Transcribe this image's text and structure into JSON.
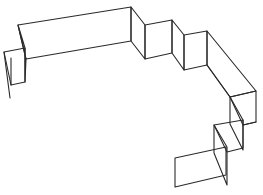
{
  "figure": {
    "colors": {
      "background": "#ffffff",
      "stroke": "#2a2a2a",
      "face": "#ffffff"
    },
    "panels": [
      {
        "name": "left-end-panel",
        "points": "4,52 25,48 25,82 11,85"
      },
      {
        "name": "left-fold",
        "points": "18,25 25,48 25,82 26,59"
      },
      {
        "name": "long-front-panel",
        "points": "18,25 131,7 131,41 26,59"
      },
      {
        "name": "fold-1",
        "points": "131,7 145,25 145,59 131,41"
      },
      {
        "name": "panel-2",
        "points": "145,25 172,20 172,53 145,59"
      },
      {
        "name": "fold-2",
        "points": "172,20 184,35 184,70 172,53"
      },
      {
        "name": "panel-3",
        "points": "184,35 207,31 207,65 184,70"
      },
      {
        "name": "long-diagonal-top",
        "points": "207,31 256,91 230,97 207,65"
      },
      {
        "name": "end-face-upper",
        "points": "230,97 256,91 256,122 243,125"
      },
      {
        "name": "step-fold-upper",
        "points": "230,97 243,120 243,150 230,124"
      },
      {
        "name": "step-panel-middle",
        "points": "214,125 243,120 243,148 227,152"
      },
      {
        "name": "step-fold-lower",
        "points": "214,125 227,147 227,185 214,153"
      },
      {
        "name": "bottom-panel",
        "points": "175,158 226,147 226,175 175,187"
      }
    ],
    "extra_lines": [
      {
        "name": "left-vertical-back",
        "d": "M4,52 L10,98"
      },
      {
        "name": "left-inner-vertical",
        "d": "M11,58 L11,85"
      },
      {
        "name": "long-diagonal-bottom",
        "d": "M207,65 L230,97"
      },
      {
        "name": "upper-bottom-edge",
        "d": "M243,125 L256,122"
      }
    ]
  }
}
